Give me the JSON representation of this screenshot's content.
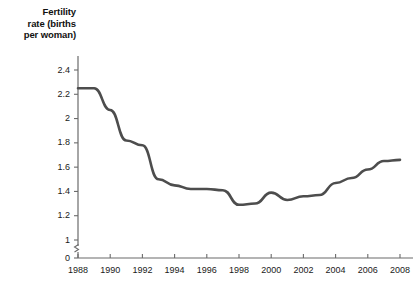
{
  "chart_data": {
    "type": "line",
    "title": "Fertility rate (births per woman)",
    "title_lines": [
      "Fertility",
      "rate (births",
      "per woman)"
    ],
    "xlabel": "",
    "ylabel": "Fertility rate (births per woman)",
    "x": [
      1988,
      1989,
      1990,
      1991,
      1992,
      1993,
      1994,
      1995,
      1996,
      1997,
      1998,
      1999,
      2000,
      2001,
      2002,
      2003,
      2004,
      2005,
      2006,
      2007,
      2008
    ],
    "values": [
      2.25,
      2.25,
      2.07,
      1.82,
      1.78,
      1.5,
      1.45,
      1.42,
      1.42,
      1.41,
      1.29,
      1.3,
      1.39,
      1.33,
      1.36,
      1.37,
      1.47,
      1.51,
      1.58,
      1.65,
      1.66
    ],
    "series": [
      {
        "name": "Fertility rate",
        "values": [
          2.25,
          2.25,
          2.07,
          1.82,
          1.78,
          1.5,
          1.45,
          1.42,
          1.42,
          1.41,
          1.29,
          1.3,
          1.39,
          1.33,
          1.36,
          1.37,
          1.47,
          1.51,
          1.58,
          1.65,
          1.66
        ],
        "color": "#4d4d4d"
      }
    ],
    "xlim": [
      1988,
      2008
    ],
    "ylim": [
      1.0,
      2.4
    ],
    "y_axis_break": true,
    "y_break_label": "0",
    "xticks": [
      1988,
      1990,
      1992,
      1994,
      1996,
      1998,
      2000,
      2002,
      2004,
      2006,
      2008
    ],
    "xtick_labels": [
      "1988",
      "1990",
      "1992",
      "1994",
      "1996",
      "1998",
      "2000",
      "2002",
      "2004",
      "2006",
      "2008"
    ],
    "yticks": [
      2.4,
      2.2,
      2.0,
      1.8,
      1.6,
      1.4,
      1.2,
      1.0,
      0
    ],
    "ytick_labels": [
      "2.4",
      "2.2",
      "2",
      "1.8",
      "1.6",
      "1.4",
      "1.2",
      "1",
      "0"
    ],
    "grid": false,
    "legend": null,
    "legend_position": "none",
    "line_color": "#4d4d4d",
    "axis_color": "#6b6b6b",
    "background": "#ffffff"
  }
}
